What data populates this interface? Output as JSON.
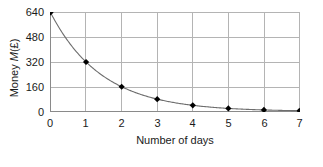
{
  "chart_data": {
    "type": "line",
    "title": "",
    "xlabel": "Number of days",
    "ylabel": "Money M(£)",
    "ylabel_prefix": "Money ",
    "ylabel_italic": "M",
    "ylabel_suffix": "(£)",
    "x": [
      0,
      1,
      2,
      3,
      4,
      5,
      6,
      7
    ],
    "values": [
      640,
      320,
      160,
      80,
      40,
      20,
      10,
      5
    ],
    "xticks": [
      "0",
      "1",
      "2",
      "3",
      "4",
      "5",
      "6",
      "7"
    ],
    "yticks": [
      "0",
      "160",
      "320",
      "480",
      "640"
    ],
    "ytick_values": [
      0,
      160,
      320,
      480,
      640
    ],
    "xlim": [
      0,
      7
    ],
    "ylim": [
      0,
      640
    ],
    "grid": true,
    "legend": false,
    "marker": "diamond",
    "line_color": "#6e6e6e",
    "marker_color": "#000000",
    "grid_color": "#b4b4b4",
    "text_color": "#1a1a1a"
  }
}
